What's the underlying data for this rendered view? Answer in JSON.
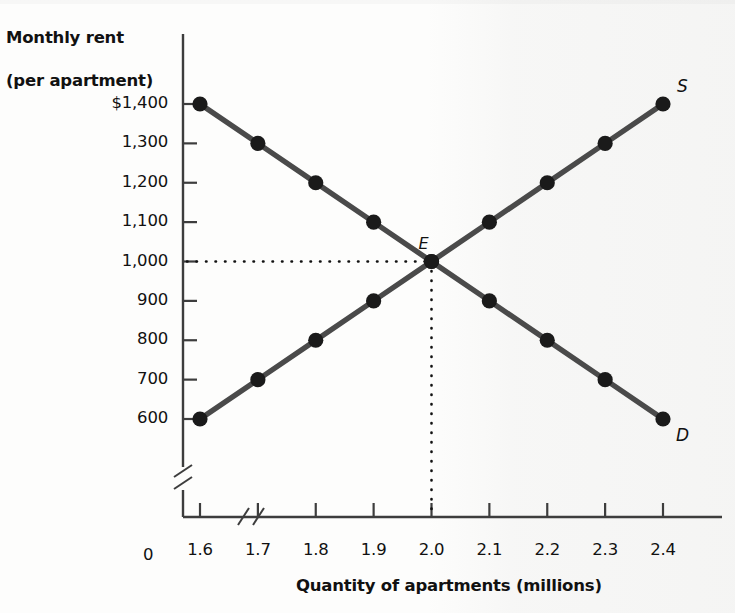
{
  "chart_data": {
    "type": "line",
    "title": "",
    "ylabel": "Monthly rent\n(per apartment)",
    "ylabel_line1": "Monthly rent",
    "ylabel_line2": "(per apartment)",
    "xlabel": "Quantity of apartments (millions)",
    "x": [
      1.6,
      1.7,
      1.8,
      1.9,
      2.0,
      2.1,
      2.2,
      2.3,
      2.4
    ],
    "xtick_labels": [
      "1.6",
      "1.7",
      "1.8",
      "1.9",
      "2.0",
      "2.1",
      "2.2",
      "2.3",
      "2.4"
    ],
    "ytick_values": [
      600,
      700,
      800,
      900,
      1000,
      1100,
      1200,
      1300,
      1400
    ],
    "ytick_labels": [
      "600",
      "700",
      "800",
      "900",
      "1,000",
      "1,100",
      "1,200",
      "1,300",
      "$1,400"
    ],
    "xlim": [
      1.55,
      2.45
    ],
    "ylim": [
      560,
      1440
    ],
    "grid": false,
    "origin_label": "0",
    "axis_break_x": "//",
    "axis_break_y": "//",
    "legend_position": "inline-curve-end",
    "series": [
      {
        "name": "D",
        "label": "D",
        "description": "Demand curve",
        "color": "#4a4a4a",
        "marker": "filled-circle",
        "values": [
          1400,
          1300,
          1200,
          1100,
          1000,
          900,
          800,
          700,
          600
        ]
      },
      {
        "name": "S",
        "label": "S",
        "description": "Supply curve",
        "color": "#4a4a4a",
        "marker": "filled-circle",
        "values": [
          600,
          700,
          800,
          900,
          1000,
          1100,
          1200,
          1300,
          1400
        ]
      }
    ],
    "annotations": [
      {
        "name": "equilibrium",
        "label": "E",
        "x": 2.0,
        "y": 1000,
        "guides": "dotted-to-both-axes"
      }
    ]
  },
  "colors": {
    "curve": "#4a4a4a",
    "marker": "#1a1a1a",
    "axis": "#3d3d3d",
    "text": "#111111",
    "background": "#fdfdfc"
  }
}
